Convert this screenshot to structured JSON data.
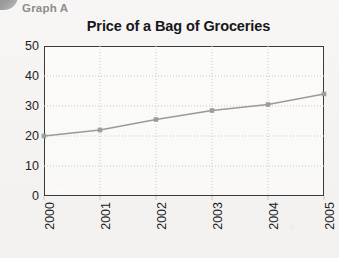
{
  "header": {
    "graph_label": "Graph A",
    "corner_mark_name": "page-corner-mark"
  },
  "chart_data": {
    "type": "line",
    "title": "Price of a Bag of Groceries",
    "xlabel": "",
    "ylabel": "",
    "categories": [
      "2000",
      "2001",
      "2002",
      "2003",
      "2004",
      "2005"
    ],
    "values": [
      20,
      22,
      25.5,
      28.5,
      30.5,
      34
    ],
    "series": [
      {
        "name": "Price of a Bag of Groceries",
        "values": [
          20,
          22,
          25.5,
          28.5,
          30.5,
          34
        ]
      }
    ],
    "ylim": [
      0,
      50
    ],
    "yticks": [
      0,
      10,
      20,
      30,
      40,
      50
    ],
    "xticks": [
      "2000",
      "2001",
      "2002",
      "2003",
      "2004",
      "2005"
    ],
    "grid": true,
    "grid_style": "dotted",
    "legend": false,
    "legend_position": "none",
    "marker": "square",
    "line_color": "#9a9a9a",
    "marker_color": "#9d9d9d",
    "grid_color": "#c9c9c9",
    "axis_color": "#3a3a3a",
    "title_color": "#17171a",
    "label_color": "#8d8d8d",
    "xtick_rotation": -90
  }
}
